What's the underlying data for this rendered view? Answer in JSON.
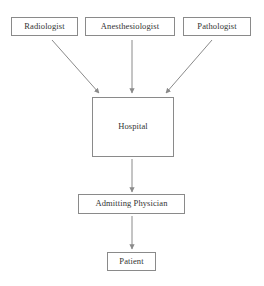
{
  "diagram": {
    "background_color": "#ffffff",
    "border_color": "#8a8a8a",
    "text_color": "#333333",
    "arrow_color": "#8a8a8a",
    "nodes": [
      {
        "id": "radiologist",
        "label": "Radiologist"
      },
      {
        "id": "anesthesiologist",
        "label": "Anesthesiologist"
      },
      {
        "id": "pathologist",
        "label": "Pathologist"
      },
      {
        "id": "hospital",
        "label": "Hospital"
      },
      {
        "id": "admitting_physician",
        "label": "Admitting Physician"
      },
      {
        "id": "patient",
        "label": "Patient"
      }
    ],
    "edges": [
      {
        "id": "radiologist-to-hospital",
        "from": "radiologist",
        "to": "hospital",
        "style": "diagonal-arrow"
      },
      {
        "id": "anesthesiologist-to-hospital",
        "from": "anesthesiologist",
        "to": "hospital",
        "style": "vertical-arrow"
      },
      {
        "id": "pathologist-to-hospital",
        "from": "pathologist",
        "to": "hospital",
        "style": "diagonal-arrow"
      },
      {
        "id": "hospital-to-admitting-physician",
        "from": "hospital",
        "to": "admitting_physician",
        "style": "vertical-arrow"
      },
      {
        "id": "admitting-physician-to-patient",
        "from": "admitting_physician",
        "to": "patient",
        "style": "vertical-arrow"
      }
    ]
  }
}
